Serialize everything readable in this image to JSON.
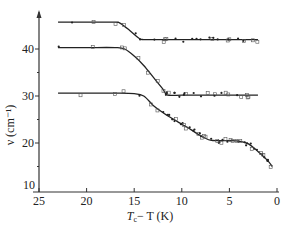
{
  "chart_data": {
    "type": "line",
    "title": "",
    "xlabel": "T_c − T (K)",
    "ylabel": "ν (cm⁻¹)",
    "xlim": [
      25,
      0
    ],
    "ylim": [
      10,
      48
    ],
    "x_reversed": true,
    "x_ticks": [
      25,
      20,
      15,
      10,
      5,
      0
    ],
    "y_ticks": [
      10,
      20,
      30,
      40
    ],
    "grid": false,
    "legend": null,
    "series": [
      {
        "name": "mode 1",
        "x": [
          23,
          20,
          17,
          16.5,
          15.5,
          14.5,
          14,
          12,
          10,
          8,
          6,
          4,
          2
        ],
        "y": [
          45.7,
          45.7,
          45.7,
          45.5,
          44,
          42.3,
          42,
          42,
          42,
          42,
          42,
          42,
          42
        ]
      },
      {
        "name": "mode 2",
        "x": [
          23,
          20,
          17,
          16,
          15,
          14,
          13,
          12,
          11.5,
          10,
          8,
          6,
          4,
          2
        ],
        "y": [
          40.3,
          40.3,
          40.3,
          40,
          38.5,
          36.5,
          34,
          31.5,
          30.2,
          30.2,
          30.2,
          30.2,
          30.2,
          30.2
        ]
      },
      {
        "name": "mode 3",
        "x": [
          23,
          20,
          17,
          15,
          14,
          13,
          12,
          11,
          10,
          9,
          8,
          7,
          6,
          5,
          4,
          3,
          2,
          1,
          0.5
        ],
        "y": [
          30.6,
          30.6,
          30.6,
          30.5,
          30,
          28,
          26.5,
          25.2,
          24,
          22.8,
          21.5,
          20.6,
          20.5,
          20.5,
          20.4,
          19.8,
          18.2,
          16.3,
          15
        ]
      }
    ]
  },
  "axes": {
    "x_tick_labels": [
      "25",
      "20",
      "15",
      "10",
      "5",
      "0"
    ],
    "y_tick_labels": [
      "40",
      "30",
      "20",
      "10"
    ],
    "x_label_main": "T",
    "x_label_sub": "c",
    "x_label_rest": "− T (K)",
    "y_label": "ν (cm⁻¹)"
  }
}
